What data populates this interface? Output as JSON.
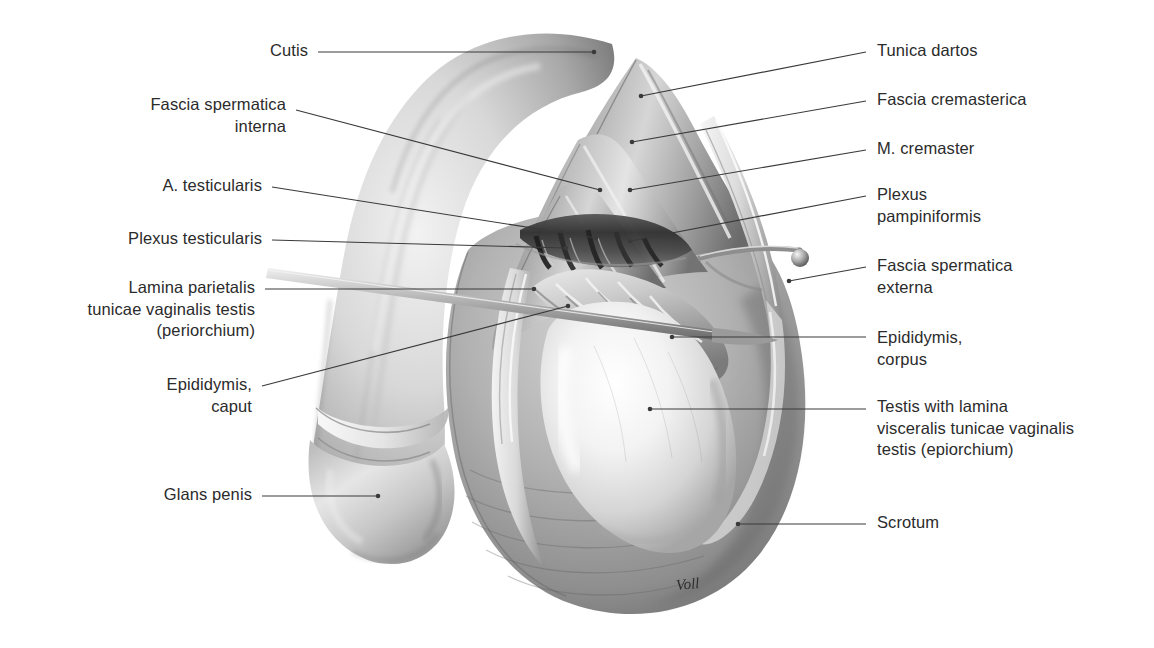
{
  "plate": {
    "title": "Coverings of the testis and spermatic cord (anterior view, dissected)",
    "signature": "Voll",
    "background_color": "#ffffff",
    "text_color": "#2b2b2b",
    "leader_color": "#3a3a3a"
  },
  "labels_left": [
    {
      "id": "cutis",
      "text": "Cutis",
      "x": 255,
      "y": 40,
      "line": [
        318,
        52,
        594,
        52
      ]
    },
    {
      "id": "fascia-spermatica-interna",
      "text": "Fascia spermatica\ninterna",
      "x": 126,
      "y": 94,
      "line": [
        296,
        110,
        600,
        190
      ]
    },
    {
      "id": "a-testicularis",
      "text": "A. testicularis",
      "x": 139,
      "y": 175,
      "line": [
        272,
        187,
        596,
        238
      ]
    },
    {
      "id": "plexus-testicularis",
      "text": "Plexus testicularis",
      "x": 104,
      "y": 228,
      "line": [
        272,
        240,
        566,
        248
      ]
    },
    {
      "id": "lamina-parietalis",
      "text": "Lamina parietalis\ntunicae vaginalis testis\n(periorchium)",
      "x": 103,
      "y": 277,
      "line": [
        265,
        289,
        534,
        289
      ]
    },
    {
      "id": "epididymis-caput",
      "text": "Epididymis,\ncaput",
      "x": 150,
      "y": 374,
      "line": [
        262,
        386,
        568,
        306
      ]
    },
    {
      "id": "glans-penis",
      "text": "Glans penis",
      "x": 152,
      "y": 484,
      "line": [
        262,
        496,
        378,
        496
      ]
    }
  ],
  "labels_right": [
    {
      "id": "tunica-dartos",
      "text": "Tunica dartos",
      "x": 877,
      "y": 40,
      "line": [
        641,
        96,
        866,
        52
      ]
    },
    {
      "id": "fascia-cremasterica",
      "text": "Fascia cremasterica",
      "x": 877,
      "y": 89,
      "line": [
        632,
        142,
        866,
        101
      ]
    },
    {
      "id": "m-cremaster",
      "text": "M. cremaster",
      "x": 877,
      "y": 138,
      "line": [
        630,
        190,
        866,
        150
      ]
    },
    {
      "id": "plexus-pampiniformis",
      "text": "Plexus\npampiniformis",
      "x": 877,
      "y": 184,
      "line": [
        630,
        241,
        866,
        196
      ]
    },
    {
      "id": "fascia-spermatica-externa",
      "text": "Fascia spermatica\nexterna",
      "x": 877,
      "y": 255,
      "line": [
        789,
        281,
        866,
        267
      ]
    },
    {
      "id": "epididymis-corpus",
      "text": "Epididymis,\ncorpus",
      "x": 877,
      "y": 327,
      "line": [
        672,
        337,
        866,
        337
      ]
    },
    {
      "id": "testis-epiorchium",
      "text": "Testis with lamina\nvisceralis tunicae vaginalis\ntestis (epiorchium)",
      "x": 877,
      "y": 396,
      "line": [
        650,
        409,
        866,
        409
      ]
    },
    {
      "id": "scrotum",
      "text": "Scrotum",
      "x": 877,
      "y": 512,
      "line": [
        738,
        524,
        866,
        524
      ]
    }
  ]
}
